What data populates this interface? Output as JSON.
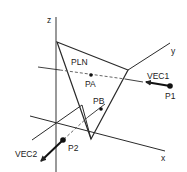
{
  "diagram": {
    "type": "3d-geometry-intersection",
    "axes": {
      "x_label": "x",
      "y_label": "y",
      "z_label": "z"
    },
    "plane": {
      "label": "PLN"
    },
    "points": {
      "pa": "PA",
      "pb": "PB",
      "p1": "P1",
      "p2": "P2"
    },
    "vectors": {
      "vec1": "VEC1",
      "vec2": "VEC2"
    },
    "colors": {
      "line": "#2a2a2a",
      "dashed": "#555555",
      "background": "#ffffff"
    }
  }
}
